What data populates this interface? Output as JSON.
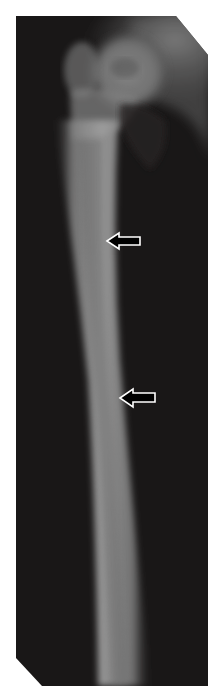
{
  "image": {
    "type": "radiograph",
    "subject": "femur",
    "view": "anteroposterior",
    "background_color": "#1c1a1a",
    "bone_color": "#9a9a9a",
    "frame_color": "#ffffff"
  },
  "annotations": [
    {
      "type": "arrow",
      "direction": "left",
      "fill": "#000000",
      "outline": "#ffffff",
      "x": 106,
      "y": 232,
      "width": 34,
      "height": 20
    },
    {
      "type": "arrow",
      "direction": "left",
      "fill": "#000000",
      "outline": "#ffffff",
      "x": 119,
      "y": 388,
      "width": 36,
      "height": 20
    }
  ]
}
